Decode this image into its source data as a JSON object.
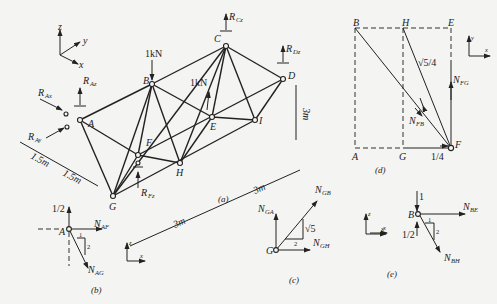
{
  "figure": {
    "panels": [
      {
        "id": "a",
        "caption": "(a)",
        "title": "Space truss with supports and loads"
      },
      {
        "id": "b",
        "caption": "(b)",
        "title": "Free body of joint A"
      },
      {
        "id": "c",
        "caption": "(c)",
        "title": "Free body of joint G"
      },
      {
        "id": "d",
        "caption": "(d)",
        "title": "Plan view projection at joint F"
      },
      {
        "id": "e",
        "caption": "(e)",
        "title": "Free body of joint B"
      }
    ],
    "panel_a": {
      "axes": {
        "z": "z",
        "y": "y",
        "x": "x"
      },
      "nodes": [
        "A",
        "B",
        "C",
        "D",
        "E",
        "F",
        "G",
        "H",
        "I"
      ],
      "loads": {
        "B": "1kN",
        "E": "1kN"
      },
      "reactions": {
        "Ax": "R",
        "Ax_sub": "Ax",
        "Ay": "R",
        "Ay_sub": "Ay",
        "Az": "R",
        "Az_sub": "Az",
        "Cz": "R",
        "Cz_sub": "Cz",
        "Dz": "R",
        "Dz_sub": "Dz",
        "Fz": "R",
        "Fz_sub": "Fz"
      },
      "dimensions": {
        "d1": "1.5m",
        "d2": "1.5m",
        "d3": "3m",
        "d4": "3m",
        "height": "3m"
      }
    },
    "panel_b": {
      "node": "A",
      "force_up": "1/2",
      "n_af": "N",
      "n_af_sub": "AF",
      "n_ag": "N",
      "n_ag_sub": "AG",
      "slope_h": "1",
      "slope_v": "2",
      "axes": {
        "z": "z",
        "x": "x"
      }
    },
    "panel_c": {
      "node": "G",
      "n_ga": "N",
      "n_ga_sub": "GA",
      "n_gb": "N",
      "n_gb_sub": "GB",
      "n_gh": "N",
      "n_gh_sub": "GH",
      "slope_h": "2",
      "slope_v": "√5",
      "axes": {
        "z": "z",
        "x": "x"
      }
    },
    "panel_d": {
      "corners": [
        "B",
        "H",
        "E",
        "A",
        "G",
        "F"
      ],
      "sqrt_label": "√5/4",
      "n_fg": "N",
      "n_fg_sub": "FG",
      "n_fb": "N",
      "n_fb_sub": "FB",
      "bottom_label": "1/4",
      "axes": {
        "y": "y",
        "x": "x"
      }
    },
    "panel_e": {
      "node": "B",
      "force_down": "1",
      "force_up": "1/2",
      "n_be": "N",
      "n_be_sub": "BE",
      "n_bh": "N",
      "n_bh_sub": "BH",
      "slope_h": "1",
      "slope_v": "2",
      "axes": {
        "z": "z",
        "x": "x"
      }
    }
  }
}
